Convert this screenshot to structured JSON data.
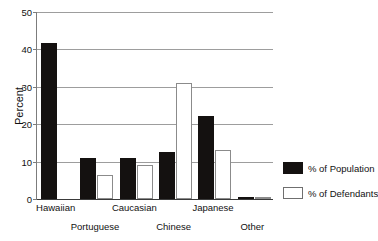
{
  "chart_data": {
    "type": "bar",
    "title": "",
    "xlabel": "",
    "ylabel": "Percent",
    "ylim": [
      0,
      50
    ],
    "yticks": [
      0,
      10,
      20,
      30,
      40,
      50
    ],
    "grid": true,
    "legend_position": "right",
    "categories": [
      "Hawaiian",
      "Portuguese",
      "Caucasian",
      "Chinese",
      "Japanese",
      "Other"
    ],
    "series": [
      {
        "name": "% of Population",
        "color": "#141110",
        "values": [
          41.7,
          11,
          11,
          12.5,
          22.2,
          0.3
        ]
      },
      {
        "name": "% of Defendants",
        "color": "#ffffff",
        "values": [
          0,
          6.5,
          9,
          31,
          13,
          0.3
        ]
      }
    ]
  },
  "axis": {
    "y_label": "Percent",
    "y_tick_labels": [
      "50",
      "40",
      "30",
      "20",
      "10",
      "0"
    ]
  },
  "x_labels": {
    "row_a": [
      "Hawaiian",
      "Caucasian",
      "Japanese"
    ],
    "row_b": [
      "Portuguese",
      "Chinese",
      "Other"
    ]
  },
  "legend": {
    "items": [
      {
        "label": "% of Population",
        "swatch": "filled-black-swatch"
      },
      {
        "label": "% of Defendants",
        "swatch": "outlined-white-swatch"
      }
    ]
  },
  "title_sliver": ""
}
